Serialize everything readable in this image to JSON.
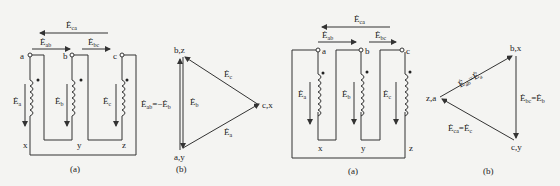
{
  "figure_left": {
    "circuit": {
      "caption": "(a)",
      "top_labels": [
        "a",
        "b",
        "c"
      ],
      "bottom_labels": [
        "x",
        "y",
        "z"
      ],
      "emf_labels": {
        "ca": {
          "main": "Ė",
          "sub": "ca"
        },
        "ab": {
          "main": "Ė",
          "sub": "ab"
        },
        "bc": {
          "main": "Ė",
          "sub": "bc"
        },
        "a": {
          "main": "Ė",
          "sub": "a"
        },
        "b": {
          "main": "Ė",
          "sub": "b"
        },
        "c": {
          "main": "Ė",
          "sub": "c"
        }
      }
    },
    "phasor": {
      "caption": "(b)",
      "vertex_top": "b,z",
      "vertex_right": "c,x",
      "vertex_bottom": "a,y",
      "label_left": "Ė",
      "label_left_sub": "ab",
      "label_left_rest": "=−Ė",
      "label_left_rest_sub": "b",
      "label_b": "Ė",
      "label_b_sub": "b",
      "label_c": "Ė",
      "label_c_sub": "c",
      "label_a": "Ė",
      "label_a_sub": "a"
    }
  },
  "figure_right": {
    "circuit": {
      "caption": "(a)",
      "top_labels": [
        "a",
        "b",
        "c"
      ],
      "bottom_labels": [
        "x",
        "y",
        "z"
      ],
      "emf_labels": {
        "ca": {
          "main": "Ė",
          "sub": "ca"
        },
        "ab": {
          "main": "Ė",
          "sub": "ab"
        },
        "bc": {
          "main": "Ė",
          "sub": "bc"
        },
        "a": {
          "main": "Ė",
          "sub": "a"
        },
        "b": {
          "main": "Ė",
          "sub": "b"
        },
        "c": {
          "main": "Ė",
          "sub": "c"
        }
      }
    },
    "phasor": {
      "caption": "(b)",
      "vertex_top": "b,x",
      "vertex_left": "z,a",
      "vertex_bottom": "c,y",
      "label_ab": "Ė",
      "label_ab_sub": "ab",
      "label_ab_rest": "=Ė",
      "label_ab_rest_sub": "a",
      "label_bc": "Ė",
      "label_bc_sub": "bc",
      "label_bc_rest": "=Ė",
      "label_bc_rest_sub": "b",
      "label_ca": "Ė",
      "label_ca_sub": "ca",
      "label_ca_rest": "=Ė",
      "label_ca_rest_sub": "c"
    }
  }
}
